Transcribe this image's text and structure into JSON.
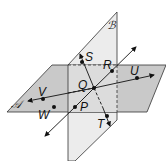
{
  "diagram": {
    "planes": [
      {
        "name": "A",
        "label": "𝒜",
        "fill": "#c8c8c8"
      },
      {
        "name": "B",
        "label": "ℬ",
        "fill": "#ebebeb"
      }
    ],
    "points": [
      {
        "name": "S",
        "label": "S"
      },
      {
        "name": "R",
        "label": "R"
      },
      {
        "name": "U",
        "label": "U"
      },
      {
        "name": "Q",
        "label": "Q"
      },
      {
        "name": "V",
        "label": "V"
      },
      {
        "name": "W",
        "label": "W"
      },
      {
        "name": "P",
        "label": "P"
      },
      {
        "name": "T",
        "label": "T"
      }
    ],
    "lines": [
      {
        "name": "line-PR",
        "through": [
          "P",
          "Q",
          "R"
        ]
      },
      {
        "name": "line-ST",
        "through": [
          "S",
          "Q",
          "T"
        ]
      },
      {
        "name": "line-VU",
        "through": [
          "V",
          "Q",
          "U"
        ]
      }
    ]
  }
}
